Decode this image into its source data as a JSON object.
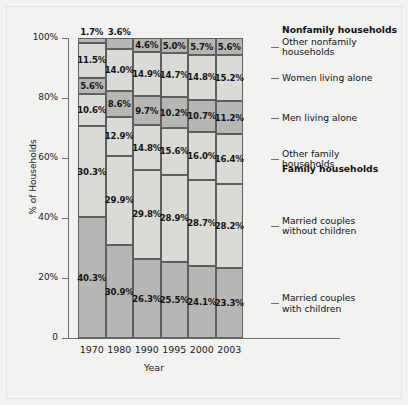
{
  "chart_data": {
    "type": "bar",
    "subtype": "stacked-bar-100-percent",
    "title": "",
    "xlabel": "Year",
    "ylabel": "% of Households",
    "ylim": [
      0,
      100
    ],
    "ytick_labels": [
      "0",
      "20%",
      "40%",
      "60%",
      "80%",
      "100%"
    ],
    "ytick_values": [
      0,
      20,
      40,
      60,
      80,
      100
    ],
    "grid": false,
    "legend_position": "right",
    "categories": [
      "1970",
      "1980",
      "1990",
      "1995",
      "2000",
      "2003"
    ],
    "series": [
      {
        "name": "Married couples with children",
        "group": "Family households",
        "shade": "dark",
        "values": [
          40.3,
          30.9,
          26.3,
          25.5,
          24.1,
          23.3
        ],
        "labels": [
          "40.3%",
          "30.9%",
          "26.3%",
          "25.5%",
          "24.1%",
          "23.3%"
        ]
      },
      {
        "name": "Married couples without children",
        "group": "Family households",
        "shade": "light",
        "values": [
          30.3,
          29.9,
          29.8,
          28.9,
          28.7,
          28.2
        ],
        "labels": [
          "30.3%",
          "29.9%",
          "29.8%",
          "28.9%",
          "28.7%",
          "28.2%"
        ]
      },
      {
        "name": "Other family households",
        "group": "Family households",
        "shade": "light",
        "values": [
          10.6,
          12.9,
          14.8,
          15.6,
          16.0,
          16.4
        ],
        "labels": [
          "10.6%",
          "12.9%",
          "14.8%",
          "15.6%",
          "16.0%",
          "16.4%"
        ]
      },
      {
        "name": "Men living alone",
        "group": "Nonfamily households",
        "shade": "dark",
        "values": [
          5.6,
          8.6,
          9.7,
          10.2,
          10.7,
          11.2
        ],
        "labels": [
          "5.6%",
          "8.6%",
          "9.7%",
          "10.2%",
          "10.7%",
          "11.2%"
        ]
      },
      {
        "name": "Women living alone",
        "group": "Nonfamily households",
        "shade": "light",
        "values": [
          11.5,
          14.0,
          14.9,
          14.7,
          14.8,
          15.2
        ],
        "labels": [
          "11.5%",
          "14.0%",
          "14.9%",
          "14.7%",
          "14.8%",
          "15.2%"
        ]
      },
      {
        "name": "Other nonfamily households",
        "group": "Nonfamily households",
        "shade": "dark",
        "values": [
          1.7,
          3.6,
          4.6,
          5.0,
          5.7,
          5.6
        ],
        "labels": [
          "1.7%",
          "3.6%",
          "4.6%",
          "5.0%",
          "5.7%",
          "5.6%"
        ]
      }
    ]
  },
  "legend": {
    "groups": [
      {
        "heading": "Nonfamily households"
      },
      {
        "heading": "Family households"
      }
    ],
    "items": [
      {
        "label": "Other nonfamily households"
      },
      {
        "label": "Women living alone"
      },
      {
        "label": "Men living alone"
      },
      {
        "label": "Other family households"
      },
      {
        "label": "Married couples without children"
      },
      {
        "label": "Married couples with children"
      }
    ]
  },
  "colors": {
    "dark_segment": "#b6b6b4",
    "light_segment": "#dadad6",
    "segment_border": "#5f5f5f",
    "axis": "#6e6e6e",
    "text": "#141414",
    "background": "#f2f2f1"
  }
}
